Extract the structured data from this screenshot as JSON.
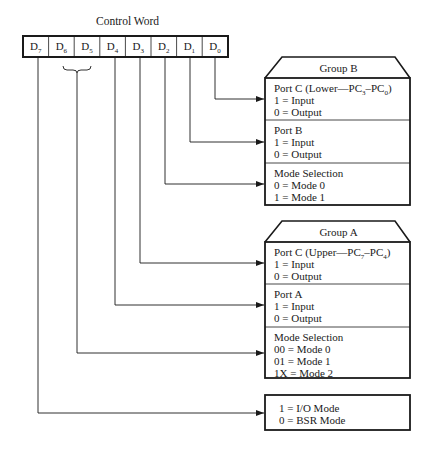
{
  "title": "Control Word",
  "register": {
    "bits": [
      {
        "name": "D",
        "sub": "7"
      },
      {
        "name": "D",
        "sub": "6"
      },
      {
        "name": "D",
        "sub": "5"
      },
      {
        "name": "D",
        "sub": "4"
      },
      {
        "name": "D",
        "sub": "3"
      },
      {
        "name": "D",
        "sub": "2"
      },
      {
        "name": "D",
        "sub": "1"
      },
      {
        "name": "D",
        "sub": "0"
      }
    ]
  },
  "group_b": {
    "title": "Group B",
    "sections": [
      {
        "heading": "Port C (Lower—PC",
        "heading_sub1": "3",
        "heading_mid": "–PC",
        "heading_sub2": "0",
        "heading_end": ")",
        "lines": [
          "1 = Input",
          "0 = Output"
        ],
        "source_bit": "D0"
      },
      {
        "heading": "Port B",
        "lines": [
          "1 = Input",
          "0 = Output"
        ],
        "source_bit": "D1"
      },
      {
        "heading": "Mode Selection",
        "lines": [
          "0 = Mode 0",
          "1 = Mode 1"
        ],
        "source_bit": "D2"
      }
    ]
  },
  "group_a": {
    "title": "Group A",
    "sections": [
      {
        "heading": "Port C (Upper—PC",
        "heading_sub1": "7",
        "heading_mid": "–PC",
        "heading_sub2": "4",
        "heading_end": ")",
        "lines": [
          "1 = Input",
          "0 = Output"
        ],
        "source_bit": "D3"
      },
      {
        "heading": "Port A",
        "lines": [
          "1 = Input",
          "0 = Output"
        ],
        "source_bit": "D4"
      },
      {
        "heading": "Mode Selection",
        "lines": [
          "00 = Mode 0",
          "01 = Mode 1",
          "1X = Mode 2"
        ],
        "source_bit": "D6-D5"
      }
    ]
  },
  "mode_flag": {
    "lines": [
      "1 = I/O Mode",
      "0 = BSR Mode"
    ],
    "source_bit": "D7"
  },
  "colors": {
    "line": "#1a1a1a",
    "background": "#ffffff"
  }
}
